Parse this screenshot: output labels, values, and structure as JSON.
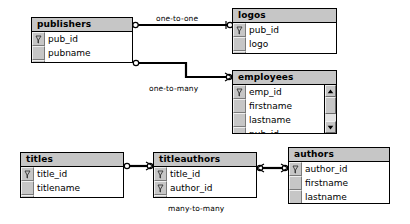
{
  "diagram": {
    "colors": {
      "table_fill": "#c6c6c6",
      "field_fill": "#ffffff",
      "border": "#000000",
      "connector": "#000000",
      "scroll_track": "#e4e4e4"
    },
    "tables": [
      {
        "name": "publishers",
        "fields": [
          {
            "label": "pub_id",
            "key": true
          },
          {
            "label": "pubname",
            "key": false
          }
        ]
      },
      {
        "name": "logos",
        "fields": [
          {
            "label": "pub_id",
            "key": true
          },
          {
            "label": "logo",
            "key": false
          }
        ]
      },
      {
        "name": "employees",
        "scrollable": true,
        "fields": [
          {
            "label": "emp_id",
            "key": true
          },
          {
            "label": "firstname",
            "key": false
          },
          {
            "label": "lastname",
            "key": false
          },
          {
            "label": "pub_id",
            "key": false
          }
        ]
      },
      {
        "name": "titles",
        "fields": [
          {
            "label": "title_id",
            "key": true
          },
          {
            "label": "titlename",
            "key": false
          }
        ]
      },
      {
        "name": "titleauthors",
        "fields": [
          {
            "label": "title_id",
            "key": true
          },
          {
            "label": "author_id",
            "key": true
          }
        ]
      },
      {
        "name": "authors",
        "fields": [
          {
            "label": "author_id",
            "key": true
          },
          {
            "label": "firstname",
            "key": false
          },
          {
            "label": "lastname",
            "key": false
          }
        ]
      }
    ],
    "relationships": [
      {
        "label": "one-to-one",
        "from": "publishers",
        "to": "logos"
      },
      {
        "label": "one-to-many",
        "from": "publishers",
        "to": "employees"
      },
      {
        "label": "many-to-many",
        "from": "titles",
        "to": "authors"
      }
    ],
    "scrollbar": {
      "up_arrow": "scroll-up-arrow",
      "down_arrow": "scroll-down-arrow",
      "thumb": "scroll-thumb"
    },
    "icons": {
      "primary_key": "key-icon"
    }
  }
}
